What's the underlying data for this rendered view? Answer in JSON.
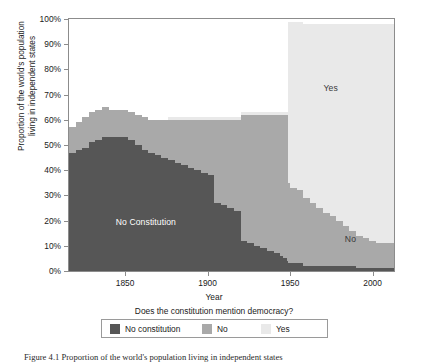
{
  "chart_data": {
    "type": "area",
    "stacked": true,
    "title": "",
    "xlabel": "Year",
    "ylabel": "Proportion of the world's population living in independent states",
    "legend_title": "Does the constitution mention democracy?",
    "legend_position": "bottom",
    "grid": false,
    "xlim": [
      1816,
      2013
    ],
    "ylim": [
      0,
      100
    ],
    "xticks": [
      1850,
      1900,
      1950,
      2000
    ],
    "xtick_labels": [
      "1850",
      "1900",
      "1950",
      "2000"
    ],
    "yticks": [
      0,
      10,
      20,
      30,
      40,
      50,
      60,
      70,
      80,
      90,
      100
    ],
    "ytick_labels": [
      "0%",
      "10%",
      "20%",
      "30%",
      "40%",
      "50%",
      "60%",
      "70%",
      "80%",
      "90%",
      "100%"
    ],
    "colors": {
      "no_constitution": "#565656",
      "no": "#a9a9a9",
      "yes": "#e9e9e9",
      "panel_border": "#8c8c8c",
      "background": "#ffffff",
      "text": "#1a1a1a",
      "inlabel_light": "#ffffff",
      "inlabel_dark": "#3a3a3a"
    },
    "annotations": [
      {
        "text": "No Constitution",
        "x": 1862,
        "y": 20,
        "color": "#ffffff"
      },
      {
        "text": "Yes",
        "x": 1974,
        "y": 73,
        "color": "#3a3a3a"
      },
      {
        "text": "No",
        "x": 1986,
        "y": 13,
        "color": "#3a3a3a"
      }
    ],
    "x": [
      1816,
      1820,
      1824,
      1828,
      1832,
      1836,
      1840,
      1844,
      1848,
      1852,
      1856,
      1860,
      1864,
      1868,
      1872,
      1876,
      1880,
      1884,
      1888,
      1892,
      1896,
      1900,
      1904,
      1908,
      1912,
      1916,
      1920,
      1924,
      1928,
      1932,
      1936,
      1940,
      1944,
      1946,
      1948,
      1949,
      1950,
      1954,
      1958,
      1962,
      1966,
      1970,
      1974,
      1978,
      1982,
      1986,
      1990,
      1994,
      1998,
      2002,
      2006,
      2010,
      2013
    ],
    "series": [
      {
        "name": "No constitution",
        "values": [
          47,
          48,
          49,
          51,
          52,
          53,
          53,
          53,
          53,
          52,
          50,
          48,
          47,
          46,
          45,
          44,
          43,
          42,
          41,
          40,
          39,
          38,
          27,
          26,
          25,
          24,
          12,
          11,
          10,
          9,
          8,
          7,
          6,
          5,
          4,
          3,
          3,
          3,
          2,
          2,
          2,
          2,
          2,
          2,
          2,
          2,
          1,
          1,
          1,
          1,
          1,
          1,
          1
        ]
      },
      {
        "name": "No",
        "values": [
          10,
          11,
          12,
          12,
          12,
          12,
          11,
          11,
          11,
          11,
          12,
          13,
          13,
          14,
          15,
          16,
          17,
          18,
          19,
          20,
          21,
          22,
          33,
          34,
          35,
          36,
          50,
          51,
          52,
          53,
          54,
          55,
          56,
          57,
          58,
          32,
          30,
          29,
          27,
          25,
          23,
          21,
          20,
          18,
          16,
          14,
          13,
          12,
          11,
          10,
          10,
          10,
          10
        ]
      },
      {
        "name": "Yes",
        "values": [
          0,
          0,
          0,
          0,
          0,
          0,
          0,
          0,
          0,
          0,
          0,
          0,
          0,
          0,
          0,
          1,
          1,
          1,
          1,
          1,
          1,
          1,
          1,
          1,
          1,
          1,
          1,
          1,
          1,
          1,
          1,
          1,
          1,
          1,
          1,
          64,
          66,
          67,
          69,
          71,
          73,
          75,
          76,
          78,
          80,
          82,
          84,
          85,
          86,
          87,
          87,
          87,
          87
        ]
      }
    ]
  },
  "caption": {
    "text": "Figure 4.1  Proportion of the world's population living in independent states"
  },
  "legend": {
    "title": "Does the constitution mention democracy?",
    "items": [
      {
        "label": "No constitution",
        "color": "#565656"
      },
      {
        "label": "No",
        "color": "#a9a9a9"
      },
      {
        "label": "Yes",
        "color": "#e9e9e9"
      }
    ]
  },
  "axes": {
    "y_title_line1": "Proportion of the world's population",
    "y_title_line2": "living in independent states",
    "x_title": "Year"
  }
}
